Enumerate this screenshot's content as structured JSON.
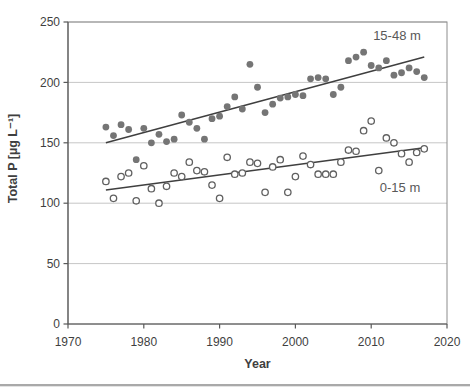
{
  "chart": {
    "y_axis_title": "Total P [µg L⁻¹]",
    "x_axis_title": "Year",
    "series_labels": {
      "deep": "15-48 m",
      "shallow": "0-15 m"
    }
  },
  "colors": {
    "grid": "#c6c6c6",
    "plot_border": "#8c8c8c",
    "axis": "#595959",
    "tick_label": "#3f3f3f",
    "trend_line": "#3f3f3f",
    "deep_marker": "#757575",
    "shallow_marker_stroke": "#606060",
    "separator": "#a9a9a9",
    "background": "#ffffff"
  },
  "chart_data": {
    "type": "scatter",
    "title": "",
    "xlabel": "Year",
    "ylabel": "Total P [µg L⁻¹]",
    "xlim": [
      1970,
      2020
    ],
    "ylim": [
      0,
      250
    ],
    "x_ticks": [
      "1970",
      "1980",
      "1990",
      "2000",
      "2010",
      "2020"
    ],
    "y_ticks": [
      "0",
      "50",
      "100",
      "150",
      "200",
      "250"
    ],
    "grid": "horizontal-only",
    "legend": "inline-text-labels",
    "series": [
      {
        "name": "15-48 m",
        "marker": "filled-circle",
        "points": [
          [
            1975,
            163
          ],
          [
            1976,
            156
          ],
          [
            1977,
            165
          ],
          [
            1978,
            161
          ],
          [
            1979,
            136
          ],
          [
            1980,
            162
          ],
          [
            1981,
            150
          ],
          [
            1982,
            157
          ],
          [
            1983,
            151
          ],
          [
            1984,
            153
          ],
          [
            1985,
            173
          ],
          [
            1986,
            167
          ],
          [
            1987,
            162
          ],
          [
            1988,
            153
          ],
          [
            1989,
            170
          ],
          [
            1990,
            172
          ],
          [
            1991,
            180
          ],
          [
            1992,
            188
          ],
          [
            1993,
            178
          ],
          [
            1994,
            215
          ],
          [
            1995,
            196
          ],
          [
            1996,
            175
          ],
          [
            1997,
            182
          ],
          [
            1998,
            187
          ],
          [
            1999,
            188
          ],
          [
            2000,
            190
          ],
          [
            2001,
            189
          ],
          [
            2002,
            203
          ],
          [
            2003,
            204
          ],
          [
            2004,
            203
          ],
          [
            2005,
            190
          ],
          [
            2006,
            196
          ],
          [
            2007,
            218
          ],
          [
            2008,
            221
          ],
          [
            2009,
            225
          ],
          [
            2010,
            214
          ],
          [
            2011,
            212
          ],
          [
            2012,
            218
          ],
          [
            2013,
            206
          ],
          [
            2014,
            208
          ],
          [
            2015,
            212
          ],
          [
            2016,
            209
          ],
          [
            2017,
            204
          ]
        ],
        "trendline": {
          "x": [
            1975,
            2017
          ],
          "y": [
            150,
            221
          ]
        }
      },
      {
        "name": "0-15 m",
        "marker": "open-circle",
        "points": [
          [
            1975,
            118
          ],
          [
            1976,
            104
          ],
          [
            1977,
            122
          ],
          [
            1978,
            125
          ],
          [
            1979,
            102
          ],
          [
            1980,
            131
          ],
          [
            1981,
            112
          ],
          [
            1982,
            100
          ],
          [
            1983,
            114
          ],
          [
            1984,
            125
          ],
          [
            1985,
            122
          ],
          [
            1986,
            134
          ],
          [
            1987,
            127
          ],
          [
            1988,
            126
          ],
          [
            1989,
            115
          ],
          [
            1990,
            104
          ],
          [
            1991,
            138
          ],
          [
            1992,
            124
          ],
          [
            1993,
            125
          ],
          [
            1994,
            134
          ],
          [
            1995,
            133
          ],
          [
            1996,
            109
          ],
          [
            1997,
            130
          ],
          [
            1998,
            136
          ],
          [
            1999,
            109
          ],
          [
            2000,
            122
          ],
          [
            2001,
            139
          ],
          [
            2002,
            132
          ],
          [
            2003,
            124
          ],
          [
            2004,
            124
          ],
          [
            2005,
            124
          ],
          [
            2006,
            134
          ],
          [
            2007,
            144
          ],
          [
            2008,
            143
          ],
          [
            2009,
            160
          ],
          [
            2010,
            168
          ],
          [
            2011,
            127
          ],
          [
            2012,
            154
          ],
          [
            2013,
            150
          ],
          [
            2014,
            141
          ],
          [
            2015,
            134
          ],
          [
            2016,
            142
          ],
          [
            2017,
            145
          ]
        ],
        "trendline": {
          "x": [
            1975,
            2017
          ],
          "y": [
            111,
            146
          ]
        }
      }
    ]
  }
}
